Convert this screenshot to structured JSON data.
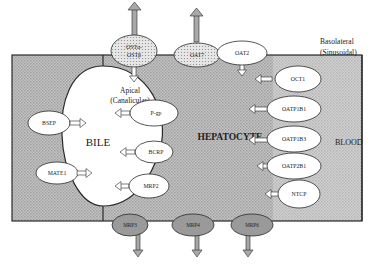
{
  "regions": {
    "hepatocyte": "HEPATOCYTE",
    "bile": "BILE",
    "blood": "BLOOD",
    "apical_line1": "Apical",
    "apical_line2": "(Canalicular)",
    "basolateral_line1": "Basolateral",
    "basolateral_line2": "(Sinusoidal)"
  },
  "top_transporters": [
    {
      "label_line1": "OSTα-",
      "label_line2": "OSTβ",
      "style": "dotted",
      "direction": "bidirectional"
    },
    {
      "label": "OAT7",
      "style": "dotted",
      "direction": "efflux"
    },
    {
      "label": "OAT2",
      "style": "white",
      "direction": "uptake"
    }
  ],
  "basolateral_uptake": [
    {
      "label": "OCT1"
    },
    {
      "label": "OATP1B1"
    },
    {
      "label": "OATP1B3"
    },
    {
      "label": "OATP2B1"
    },
    {
      "label": "NTCP"
    }
  ],
  "apical_efflux": [
    {
      "label": "BSEP"
    },
    {
      "label": "P-gp"
    },
    {
      "label": "BCRP"
    },
    {
      "label": "MATE1"
    },
    {
      "label": "MRP2"
    }
  ],
  "basolateral_efflux": [
    {
      "label": "MRP3"
    },
    {
      "label": "MRP4"
    },
    {
      "label": "MRP6"
    }
  ],
  "colors": {
    "cell_fill": "#b8b8b8",
    "cell_fill_light": "#cfcfcf",
    "outline": "#2a2a2a",
    "efflux_ellipse": "#9a9a9a",
    "dotted_ellipse": "#d6d6d6",
    "arrow_fill": "#a8a8a8"
  }
}
